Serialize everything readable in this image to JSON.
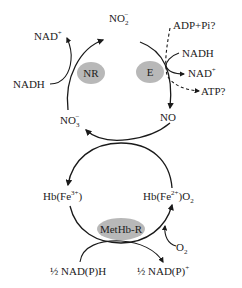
{
  "diagram": {
    "type": "biochemical-cycle",
    "colors": {
      "line": "#1a1a1a",
      "enzyme_fill": "#b8b8b8",
      "text": "#222222",
      "background": "#ffffff"
    },
    "top_cycle": {
      "nodes": {
        "nitrite": {
          "base": "NO",
          "sub": "2",
          "sup": "−"
        },
        "nitric_oxide": {
          "label": "NO"
        },
        "nitrate": {
          "base": "NO",
          "sub": "3",
          "sup": "−"
        }
      },
      "enzymes": {
        "nitrate_reductase": {
          "label": "NR"
        },
        "nitrite_enzyme": {
          "label": "E"
        }
      },
      "cofactors": {
        "nr_nad_plus": {
          "base": "NAD",
          "sup": "+"
        },
        "nr_nadh": {
          "label": "NADH"
        },
        "e_adp_pi": {
          "label": "ADP+Pi?"
        },
        "e_nadh": {
          "label": "NADH"
        },
        "e_nad_plus": {
          "base": "NAD",
          "sup": "+"
        },
        "e_atp": {
          "label": "ATP?"
        }
      }
    },
    "bottom_cycle": {
      "nodes": {
        "methemoglobin": {
          "base": "Hb(Fe",
          "sup": "3+",
          "tail": ")"
        },
        "oxyhemoglobin": {
          "base": "Hb(Fe",
          "sup": "2+",
          "tail": ")O",
          "sub": "2"
        }
      },
      "enzymes": {
        "methb_reductase": {
          "label": "MetHb-R"
        }
      },
      "cofactors": {
        "oxygen": {
          "base": "O",
          "sub": "2"
        },
        "nadph_in": {
          "label": "½ NAD(P)H"
        },
        "nadp_out": {
          "base": "½ NAD(P)",
          "sup": "+"
        }
      }
    }
  }
}
